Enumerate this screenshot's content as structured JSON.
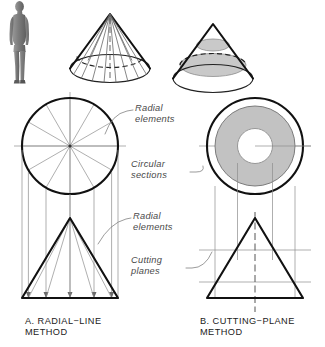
{
  "figure": {
    "background_color": "#ffffff",
    "ink_color": "#111111",
    "section_fill_color": "#c9c9c9",
    "construction_line_color": "#8c8c8c"
  },
  "callouts": {
    "radial_elements_top": "Radial\nelements",
    "circular_sections": "Circular\nsections",
    "radial_elements_front": "Radial\nelements",
    "cutting_planes": "Cutting\nplanes"
  },
  "captions": {
    "left": "A.  RADIAL−LINE\n      METHOD",
    "right": "B.  CUTTING−PLANE\n     METHOD"
  },
  "panels": {
    "left": {
      "name": "radial-line-method",
      "letter": "A.",
      "method": "RADIAL−LINE METHOD",
      "pictorial": {
        "shape": "cone",
        "element_count": 9,
        "hidden_base_edge": true,
        "axis_shown": true
      },
      "top_view": {
        "shape": "circle",
        "radial_divisions": 12,
        "division_angle_degrees": 30
      },
      "front_view": {
        "shape": "triangle",
        "radial_elements": 7,
        "projection_lines": 7,
        "arrowheads": true
      }
    },
    "right": {
      "name": "cutting-plane-method",
      "letter": "B.",
      "method": "CUTTING−PLANE METHOD",
      "pictorial": {
        "shape": "cone",
        "section_count": 2,
        "hidden_section_edge": true
      },
      "top_view": {
        "shape": "annulus",
        "outer_circle": true,
        "section_ring_filled": true
      },
      "front_view": {
        "shape": "triangle",
        "cutting_planes": 2,
        "centerline": true
      }
    }
  },
  "scale_figure": {
    "name": "human-scale-figure",
    "description": "standing human silhouette"
  }
}
